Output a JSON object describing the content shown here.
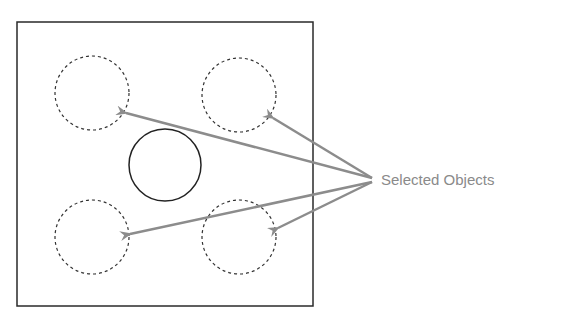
{
  "diagram": {
    "label": "Selected Objects",
    "colors": {
      "frame": "#2a2a2a",
      "arrow": "#8c8c8c",
      "label": "#8a8a8a"
    },
    "frame": {
      "x": 17,
      "y": 22,
      "width": 296,
      "height": 284
    },
    "objects": [
      {
        "name": "top-left",
        "cx": 92,
        "cy": 93,
        "r": 37,
        "selected": true
      },
      {
        "name": "top-right",
        "cx": 239,
        "cy": 95,
        "r": 37,
        "selected": true
      },
      {
        "name": "center",
        "cx": 165,
        "cy": 165,
        "r": 36,
        "selected": false
      },
      {
        "name": "bottom-left",
        "cx": 92,
        "cy": 237,
        "r": 37,
        "selected": true
      },
      {
        "name": "bottom-right",
        "cx": 239,
        "cy": 237,
        "r": 37,
        "selected": true
      }
    ]
  }
}
